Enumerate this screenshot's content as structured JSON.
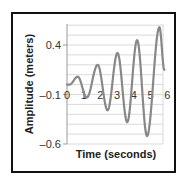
{
  "chart_data": {
    "type": "line",
    "title": "",
    "xlabel": "Time (seconds)",
    "ylabel": "Amplitude (meters)",
    "xlim": [
      0,
      6
    ],
    "ylim": [
      -0.6,
      0.6
    ],
    "x_ticks": [
      "0",
      "1",
      "2",
      "3",
      "4",
      "5",
      "6"
    ],
    "y_ticks": [
      "0.4",
      "-0.1",
      "-0.6"
    ],
    "y_tick_values": [
      0.4,
      -0.1,
      -0.6
    ],
    "grid": true,
    "grid_step": 0.1,
    "legend": null,
    "series": [
      {
        "name": "Amplitude",
        "color": "#888888",
        "x": [
          0,
          0.15,
          0.65,
          1.2,
          1.86,
          2.46,
          3.06,
          3.65,
          4.25,
          4.85,
          5.6,
          5.9
        ],
        "values": [
          0.0,
          0.0,
          0.08,
          -0.13,
          0.2,
          -0.26,
          0.32,
          -0.38,
          0.45,
          -0.52,
          0.58,
          0.15
        ]
      }
    ]
  }
}
